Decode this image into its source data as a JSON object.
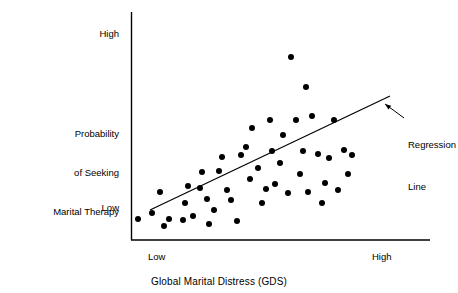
{
  "figure": {
    "background": "#ffffff",
    "ink": "#000000"
  },
  "axes": {
    "y_title_lines": [
      "Probability",
      "of Seeking",
      "Marital Therapy"
    ],
    "y_tick_high": "High",
    "y_tick_low": "Low",
    "x_title": "Global Marital Distress (GDS)",
    "x_tick_low": "Low",
    "x_tick_high": "High"
  },
  "annotations": {
    "regression_lines": [
      "Regression",
      "Line"
    ]
  },
  "chart_data": {
    "type": "scatter",
    "title": "",
    "xlabel": "Global Marital Distress (GDS)",
    "ylabel": "Probability of Seeking Marital Therapy",
    "xlim": [
      0,
      1
    ],
    "ylim": [
      0,
      1
    ],
    "xtick_labels": [
      "Low",
      "High"
    ],
    "ytick_labels": [
      "Low",
      "High"
    ],
    "grid": false,
    "legend": null,
    "marker": "filled-circle",
    "marker_color": "#000000",
    "marker_radius_px": 3.0,
    "plot_area_px": {
      "left": 131,
      "right": 430,
      "top": 12,
      "bottom": 240
    },
    "points_px": [
      [
        138,
        219
      ],
      [
        152,
        213
      ],
      [
        160,
        192
      ],
      [
        164,
        226
      ],
      [
        169,
        219
      ],
      [
        183,
        220
      ],
      [
        185,
        203
      ],
      [
        188,
        186
      ],
      [
        193,
        216
      ],
      [
        200,
        188
      ],
      [
        202,
        172
      ],
      [
        207,
        199
      ],
      [
        209,
        224
      ],
      [
        214,
        210
      ],
      [
        219,
        171
      ],
      [
        222,
        157
      ],
      [
        227,
        190
      ],
      [
        231,
        200
      ],
      [
        237,
        221
      ],
      [
        241,
        155
      ],
      [
        246,
        147
      ],
      [
        250,
        179
      ],
      [
        252,
        128
      ],
      [
        258,
        168
      ],
      [
        262,
        203
      ],
      [
        266,
        189
      ],
      [
        270,
        120
      ],
      [
        272,
        151
      ],
      [
        275,
        184
      ],
      [
        280,
        163
      ],
      [
        283,
        135
      ],
      [
        288,
        193
      ],
      [
        291,
        57
      ],
      [
        296,
        120
      ],
      [
        300,
        174
      ],
      [
        303,
        151
      ],
      [
        306,
        87
      ],
      [
        308,
        192
      ],
      [
        312,
        116
      ],
      [
        318,
        154
      ],
      [
        322,
        203
      ],
      [
        325,
        183
      ],
      [
        329,
        158
      ],
      [
        334,
        120
      ],
      [
        338,
        190
      ],
      [
        344,
        150
      ],
      [
        348,
        174
      ],
      [
        352,
        155
      ]
    ],
    "points_normalized": [
      [
        0.023,
        0.092
      ],
      [
        0.07,
        0.118
      ],
      [
        0.097,
        0.211
      ],
      [
        0.11,
        0.061
      ],
      [
        0.127,
        0.092
      ],
      [
        0.174,
        0.088
      ],
      [
        0.181,
        0.162
      ],
      [
        0.191,
        0.237
      ],
      [
        0.207,
        0.105
      ],
      [
        0.231,
        0.228
      ],
      [
        0.237,
        0.298
      ],
      [
        0.254,
        0.18
      ],
      [
        0.261,
        0.07
      ],
      [
        0.278,
        0.132
      ],
      [
        0.294,
        0.303
      ],
      [
        0.304,
        0.364
      ],
      [
        0.321,
        0.219
      ],
      [
        0.334,
        0.175
      ],
      [
        0.354,
        0.083
      ],
      [
        0.368,
        0.373
      ],
      [
        0.385,
        0.408
      ],
      [
        0.398,
        0.268
      ],
      [
        0.405,
        0.491
      ],
      [
        0.425,
        0.316
      ],
      [
        0.438,
        0.162
      ],
      [
        0.452,
        0.224
      ],
      [
        0.465,
        0.526
      ],
      [
        0.472,
        0.39
      ],
      [
        0.482,
        0.246
      ],
      [
        0.498,
        0.338
      ],
      [
        0.508,
        0.461
      ],
      [
        0.525,
        0.206
      ],
      [
        0.535,
        0.803
      ],
      [
        0.552,
        0.526
      ],
      [
        0.565,
        0.289
      ],
      [
        0.575,
        0.39
      ],
      [
        0.585,
        0.671
      ],
      [
        0.592,
        0.211
      ],
      [
        0.605,
        0.544
      ],
      [
        0.625,
        0.377
      ],
      [
        0.639,
        0.162
      ],
      [
        0.649,
        0.25
      ],
      [
        0.662,
        0.36
      ],
      [
        0.679,
        0.526
      ],
      [
        0.693,
        0.219
      ],
      [
        0.713,
        0.395
      ],
      [
        0.726,
        0.289
      ],
      [
        0.739,
        0.373
      ]
    ],
    "regression_line_px": {
      "x1": 150,
      "y1": 210,
      "x2": 390,
      "y2": 96
    },
    "regression_line_normalized": {
      "x1": 0.064,
      "y1": 0.132,
      "x2": 0.866,
      "y2": 0.632
    },
    "callout_arrow_px": {
      "x1": 404,
      "y1": 118,
      "x2": 385,
      "y2": 104
    }
  }
}
